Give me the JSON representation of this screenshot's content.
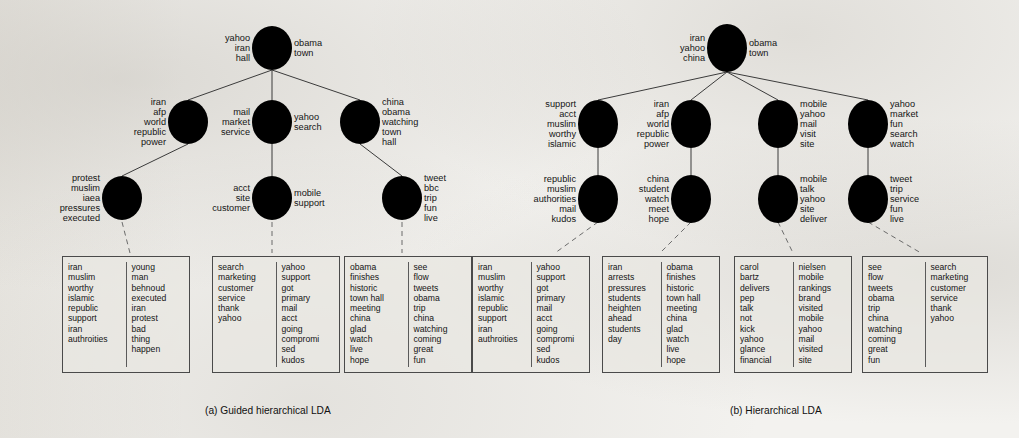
{
  "figure": {
    "captions": [
      {
        "id": "a",
        "text": "(a) Guided hierarchical LDA",
        "x": 205,
        "y": 405
      },
      {
        "id": "b",
        "text": "(b) Hierarchical LDA",
        "x": 730,
        "y": 405
      }
    ],
    "colors": {
      "page_background": "#f3f2ef",
      "ink": "#141414",
      "node_stroke": "#2f2f2f",
      "box_fill": "#e9e7e2",
      "edge": "#3b3b3b",
      "dashed_edge": "#6b6b6b"
    }
  },
  "panel_a": {
    "name": "Guided hierarchical LDA",
    "nodes": [
      {
        "id": "a-root",
        "cx": 272,
        "cy": 48,
        "rx": 20,
        "ry": 22,
        "left": [
          "yahoo",
          "iran",
          "hall"
        ],
        "right": [
          "obama",
          "town"
        ]
      },
      {
        "id": "a-l1-1",
        "cx": 188,
        "cy": 122,
        "rx": 20,
        "ry": 22,
        "left": [
          "iran",
          "afp",
          "world",
          "republic",
          "power"
        ],
        "right": []
      },
      {
        "id": "a-l1-2",
        "cx": 272,
        "cy": 122,
        "rx": 20,
        "ry": 22,
        "left": [
          "mail",
          "market",
          "service"
        ],
        "right": [
          "yahoo",
          "search"
        ]
      },
      {
        "id": "a-l1-3",
        "cx": 360,
        "cy": 122,
        "rx": 20,
        "ry": 22,
        "left": [],
        "right": [
          "china",
          "obama",
          "watching",
          "town",
          "hall"
        ]
      },
      {
        "id": "a-l2-1",
        "cx": 122,
        "cy": 198,
        "rx": 20,
        "ry": 22,
        "left": [
          "protest",
          "muslim",
          "iaea",
          "pressures",
          "executed"
        ],
        "right": []
      },
      {
        "id": "a-l2-2",
        "cx": 272,
        "cy": 198,
        "rx": 20,
        "ry": 22,
        "left": [
          "acct",
          "site",
          "customer"
        ],
        "right": [
          "mobile",
          "support"
        ]
      },
      {
        "id": "a-l2-3",
        "cx": 402,
        "cy": 198,
        "rx": 20,
        "ry": 22,
        "left": [],
        "right": [
          "tweet",
          "bbc",
          "trip",
          "fun",
          "live"
        ]
      }
    ],
    "edges": [
      {
        "from": "a-root",
        "to": "a-l1-1"
      },
      {
        "from": "a-root",
        "to": "a-l1-2"
      },
      {
        "from": "a-root",
        "to": "a-l1-3"
      },
      {
        "from": "a-l1-1",
        "to": "a-l2-1"
      },
      {
        "from": "a-l1-2",
        "to": "a-l2-2"
      },
      {
        "from": "a-l1-3",
        "to": "a-l2-3"
      }
    ],
    "leaders": [
      {
        "from": "a-l2-1",
        "x1": 122,
        "y1": 222,
        "x2": 130,
        "y2": 253
      },
      {
        "from": "a-l2-2",
        "x1": 272,
        "y1": 222,
        "x2": 272,
        "y2": 253
      },
      {
        "from": "a-l2-3",
        "x1": 402,
        "y1": 222,
        "x2": 402,
        "y2": 253
      }
    ],
    "boxes": [
      {
        "id": "a-box-1",
        "x": 62,
        "y": 256,
        "w": 128,
        "h": 117,
        "columns": [
          [
            "iran",
            "muslim",
            "worthy",
            "islamic",
            "republic",
            "support",
            "iran",
            "authroities"
          ],
          [
            "young",
            "man",
            "behnoud",
            "executed",
            "iran",
            "protest",
            "bad",
            "thing",
            "happen"
          ]
        ]
      },
      {
        "id": "a-box-2",
        "x": 212,
        "y": 256,
        "w": 128,
        "h": 117,
        "columns": [
          [
            "search",
            "marketing",
            "customer",
            "service",
            "thank",
            "yahoo"
          ],
          [
            "yahoo",
            "support",
            "got",
            "primary",
            "mail",
            "acct",
            "going",
            "compromi",
            "sed",
            "kudos"
          ]
        ]
      },
      {
        "id": "a-box-3",
        "x": 344,
        "y": 256,
        "w": 128,
        "h": 117,
        "columns": [
          [
            "obama",
            "finishes",
            "historic",
            "town hall",
            "meeting",
            "china",
            "glad",
            "watch",
            "live",
            "hope"
          ],
          [
            "see",
            "flow",
            "tweets",
            "obama",
            "trip",
            "china",
            "watching",
            "coming",
            "great",
            "fun"
          ]
        ]
      }
    ]
  },
  "panel_b": {
    "name": "Hierarchical LDA",
    "nodes": [
      {
        "id": "b-root",
        "cx": 727,
        "cy": 48,
        "rx": 20,
        "ry": 24,
        "left": [
          "iran",
          "yahoo",
          "china"
        ],
        "right": [
          "obama",
          "town"
        ]
      },
      {
        "id": "b-l1-1",
        "cx": 598,
        "cy": 124,
        "rx": 20,
        "ry": 24,
        "left": [
          "support",
          "acct",
          "muslim",
          "worthy",
          "islamic"
        ],
        "right": []
      },
      {
        "id": "b-l1-2",
        "cx": 691,
        "cy": 124,
        "rx": 20,
        "ry": 24,
        "left": [
          "iran",
          "afp",
          "world",
          "republic",
          "power"
        ],
        "right": []
      },
      {
        "id": "b-l1-3",
        "cx": 778,
        "cy": 124,
        "rx": 20,
        "ry": 24,
        "left": [],
        "right": [
          "mobile",
          "yahoo",
          "mail",
          "visit",
          "site"
        ]
      },
      {
        "id": "b-l1-4",
        "cx": 868,
        "cy": 124,
        "rx": 20,
        "ry": 24,
        "left": [],
        "right": [
          "yahoo",
          "market",
          "fun",
          "search",
          "watch"
        ]
      },
      {
        "id": "b-l2-1",
        "cx": 598,
        "cy": 199,
        "rx": 20,
        "ry": 24,
        "left": [
          "republic",
          "muslim",
          "authorities",
          "mail",
          "kudos"
        ],
        "right": []
      },
      {
        "id": "b-l2-2",
        "cx": 691,
        "cy": 199,
        "rx": 20,
        "ry": 24,
        "left": [
          "china",
          "student",
          "watch",
          "meet",
          "hope"
        ],
        "right": []
      },
      {
        "id": "b-l2-3",
        "cx": 778,
        "cy": 199,
        "rx": 20,
        "ry": 24,
        "left": [],
        "right": [
          "mobile",
          "talk",
          "yahoo",
          "site",
          "deliver"
        ]
      },
      {
        "id": "b-l2-4",
        "cx": 868,
        "cy": 199,
        "rx": 20,
        "ry": 24,
        "left": [],
        "right": [
          "tweet",
          "trip",
          "service",
          "fun",
          "live"
        ]
      }
    ],
    "edges": [
      {
        "from": "b-root",
        "to": "b-l1-1"
      },
      {
        "from": "b-root",
        "to": "b-l1-2"
      },
      {
        "from": "b-root",
        "to": "b-l1-3"
      },
      {
        "from": "b-root",
        "to": "b-l1-4"
      },
      {
        "from": "b-l1-1",
        "to": "b-l2-1"
      },
      {
        "from": "b-l1-2",
        "to": "b-l2-2"
      },
      {
        "from": "b-l1-3",
        "to": "b-l2-3"
      },
      {
        "from": "b-l1-4",
        "to": "b-l2-4"
      }
    ],
    "leaders": [
      {
        "from": "b-l2-1",
        "x1": 598,
        "y1": 222,
        "x2": 555,
        "y2": 253
      },
      {
        "from": "b-l2-2",
        "x1": 691,
        "y1": 222,
        "x2": 660,
        "y2": 253
      },
      {
        "from": "b-l2-3",
        "x1": 778,
        "y1": 222,
        "x2": 793,
        "y2": 253
      },
      {
        "from": "b-l2-4",
        "x1": 868,
        "y1": 222,
        "x2": 921,
        "y2": 253
      }
    ],
    "boxes": [
      {
        "id": "b-box-1",
        "x": 472,
        "y": 256,
        "w": 118,
        "h": 117,
        "columns": [
          [
            "iran",
            "muslim",
            "worthy",
            "islamic",
            "republic",
            "support",
            "iran",
            "authroities"
          ],
          [
            "yahoo",
            "support",
            "got",
            "primary",
            "mail",
            "acct",
            "going",
            "compromi",
            "sed",
            "kudos"
          ]
        ]
      },
      {
        "id": "b-box-2",
        "x": 602,
        "y": 256,
        "w": 118,
        "h": 117,
        "columns": [
          [
            "iran",
            "arrests",
            "pressures",
            "students",
            "heighten",
            "ahead",
            "students",
            "day"
          ],
          [
            "obama",
            "finishes",
            "historic",
            "town hall",
            "meeting",
            "china",
            "glad",
            "watch",
            "live",
            "hope"
          ]
        ]
      },
      {
        "id": "b-box-3",
        "x": 734,
        "y": 256,
        "w": 118,
        "h": 117,
        "columns": [
          [
            "carol",
            "bartz",
            "delivers",
            "pep",
            "talk",
            "not",
            "kick",
            "yahoo",
            "glance",
            "financial"
          ],
          [
            "nielsen",
            "mobile",
            "rankings",
            "brand",
            "visited",
            "mobile",
            "yahoo",
            "mail",
            "visited",
            "site"
          ]
        ]
      },
      {
        "id": "b-box-4",
        "x": 862,
        "y": 256,
        "w": 126,
        "h": 117,
        "columns": [
          [
            "see",
            "flow",
            "tweets",
            "obama",
            "trip",
            "china",
            "watching",
            "coming",
            "great",
            "fun"
          ],
          [
            "search",
            "marketing",
            "customer",
            "service",
            "thank",
            "yahoo"
          ]
        ]
      }
    ]
  }
}
